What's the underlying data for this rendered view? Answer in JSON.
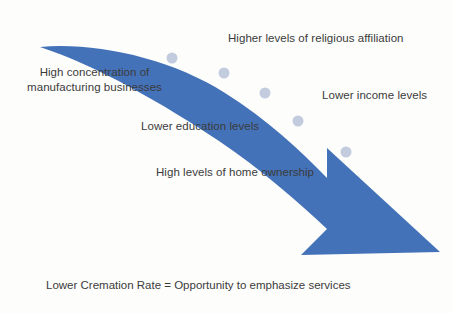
{
  "diagram": {
    "title_caption": "Lower Cremation Rate = Opportunity to emphasize services",
    "arrow": {
      "name": "downward-trend-arrow",
      "color": "#4472b8",
      "direction": "down-right",
      "milestone_dot_color": "#c3ccdf",
      "milestone_dots": [
        {
          "x": 172,
          "y": 58
        },
        {
          "x": 224,
          "y": 73
        },
        {
          "x": 265,
          "y": 93
        },
        {
          "x": 298,
          "y": 121
        },
        {
          "x": 346,
          "y": 152
        }
      ]
    },
    "labels": [
      {
        "id": "religious",
        "text": "Higher levels of religious affiliation"
      },
      {
        "id": "manufacturing",
        "text": "High concentration of manufacturing businesses"
      },
      {
        "id": "income",
        "text": "Lower income levels"
      },
      {
        "id": "education",
        "text": "Lower education levels"
      },
      {
        "id": "homeowner",
        "text": "High levels of home ownership"
      }
    ],
    "colors": {
      "background": "#fdfdfb",
      "text": "#3b3b3b",
      "accent": "#4472b8",
      "dot": "#c3ccdf"
    }
  }
}
